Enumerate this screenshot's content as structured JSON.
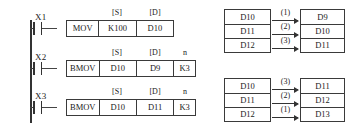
{
  "diagram": {
    "ladder": {
      "rungs": [
        {
          "contact": "X1",
          "headers": {
            "s": "[S]",
            "d": "[D]",
            "n": ""
          },
          "cells": [
            "MOV",
            "K100",
            "D10"
          ]
        },
        {
          "contact": "X2",
          "headers": {
            "s": "[S]",
            "d": "[D]",
            "n": "n"
          },
          "cells": [
            "BMOV",
            "D10",
            "D9",
            "K3"
          ]
        },
        {
          "contact": "X3",
          "headers": {
            "s": "[S]",
            "d": "[D]",
            "n": "n"
          },
          "cells": [
            "BMOV",
            "D10",
            "D11",
            "K3"
          ]
        }
      ]
    },
    "tables": [
      {
        "name": "bmov-down-transfer",
        "source": [
          "D10",
          "D11",
          "D12"
        ],
        "destination": [
          "D9",
          "D10",
          "D11"
        ],
        "order": [
          "(1)",
          "(2)",
          "(3)"
        ]
      },
      {
        "name": "bmov-up-transfer",
        "source": [
          "D10",
          "D11",
          "D12"
        ],
        "destination": [
          "D11",
          "D12",
          "D13"
        ],
        "order": [
          "(3)",
          "(2)",
          "(1)"
        ]
      }
    ]
  }
}
